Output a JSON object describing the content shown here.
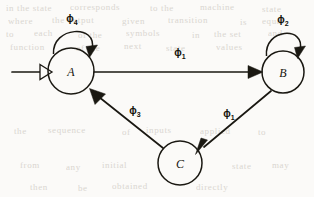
{
  "figure": {
    "kind": "state-transition-diagram",
    "caption": "",
    "background_color": "#fbfaf8",
    "ink_color": "#1a1812"
  },
  "states": [
    {
      "id": "A",
      "label": "A",
      "cx": 71,
      "cy": 71,
      "r": 23,
      "is_start": true
    },
    {
      "id": "B",
      "label": "B",
      "cx": 283,
      "cy": 72,
      "r": 21,
      "is_start": false
    },
    {
      "id": "C",
      "label": "C",
      "cx": 180,
      "cy": 163,
      "r": 22,
      "is_start": false
    }
  ],
  "start_marker": {
    "name": "start-arrow",
    "from": "A",
    "arrowhead_style": "hollow"
  },
  "transitions": [
    {
      "id": "self-a",
      "from": "A",
      "to": "A",
      "symbol": "ϕ",
      "subscript": "4",
      "label": "ϕ4",
      "kind": "self-loop",
      "label_x": 77,
      "label_y": 18,
      "arrowhead_style": "solid"
    },
    {
      "id": "self-b",
      "from": "B",
      "to": "B",
      "symbol": "ϕ",
      "subscript": "2",
      "label": "ϕ2",
      "kind": "self-loop",
      "label_x": 284,
      "label_y": 19,
      "arrowhead_style": "solid"
    },
    {
      "id": "a-to-b",
      "from": "A",
      "to": "B",
      "symbol": "ϕ",
      "subscript": "1",
      "label": "ϕ1",
      "kind": "straight",
      "label_x": 178,
      "label_y": 52,
      "arrowhead_style": "solid"
    },
    {
      "id": "b-to-c",
      "from": "B",
      "to": "C",
      "symbol": "ϕ",
      "subscript": "1",
      "label": "ϕ1",
      "kind": "straight",
      "label_x": 228,
      "label_y": 113,
      "arrowhead_style": "solid"
    },
    {
      "id": "c-to-a",
      "from": "C",
      "to": "A",
      "symbol": "ϕ",
      "subscript": "3",
      "label": "ϕ3",
      "kind": "straight",
      "label_x": 134,
      "label_y": 110,
      "arrowhead_style": "solid"
    }
  ],
  "ghost_text": [
    {
      "text": "in the state",
      "x": 6,
      "y": 3
    },
    {
      "text": "corresponds",
      "x": 70,
      "y": 2
    },
    {
      "text": "to the",
      "x": 150,
      "y": 3
    },
    {
      "text": "machine",
      "x": 200,
      "y": 2
    },
    {
      "text": "state",
      "x": 262,
      "y": 4
    },
    {
      "text": "where",
      "x": 8,
      "y": 16
    },
    {
      "text": "the output",
      "x": 52,
      "y": 15
    },
    {
      "text": "given",
      "x": 122,
      "y": 16
    },
    {
      "text": "transition",
      "x": 168,
      "y": 15
    },
    {
      "text": "is",
      "x": 240,
      "y": 17
    },
    {
      "text": "equal",
      "x": 262,
      "y": 16
    },
    {
      "text": "to",
      "x": 6,
      "y": 29
    },
    {
      "text": "each",
      "x": 34,
      "y": 28
    },
    {
      "text": "of the",
      "x": 78,
      "y": 30
    },
    {
      "text": "symbols",
      "x": 126,
      "y": 28
    },
    {
      "text": "in",
      "x": 192,
      "y": 30
    },
    {
      "text": "the set",
      "x": 214,
      "y": 29
    },
    {
      "text": "and",
      "x": 268,
      "y": 28
    },
    {
      "text": "function",
      "x": 10,
      "y": 42
    },
    {
      "text": "of the",
      "x": 76,
      "y": 43
    },
    {
      "text": "next",
      "x": 124,
      "y": 41
    },
    {
      "text": "state",
      "x": 166,
      "y": 43
    },
    {
      "text": "values",
      "x": 216,
      "y": 42
    },
    {
      "text": "the",
      "x": 14,
      "y": 126
    },
    {
      "text": "sequence",
      "x": 48,
      "y": 125
    },
    {
      "text": "of",
      "x": 122,
      "y": 127
    },
    {
      "text": "inputs",
      "x": 146,
      "y": 125
    },
    {
      "text": "applied",
      "x": 200,
      "y": 126
    },
    {
      "text": "to",
      "x": 258,
      "y": 127
    },
    {
      "text": "from",
      "x": 20,
      "y": 160
    },
    {
      "text": "any",
      "x": 66,
      "y": 162
    },
    {
      "text": "initial",
      "x": 102,
      "y": 160
    },
    {
      "text": "state",
      "x": 232,
      "y": 161
    },
    {
      "text": "may",
      "x": 272,
      "y": 160
    },
    {
      "text": "then",
      "x": 30,
      "y": 182
    },
    {
      "text": "be",
      "x": 78,
      "y": 183
    },
    {
      "text": "obtained",
      "x": 112,
      "y": 181
    },
    {
      "text": "directly",
      "x": 196,
      "y": 182
    }
  ]
}
